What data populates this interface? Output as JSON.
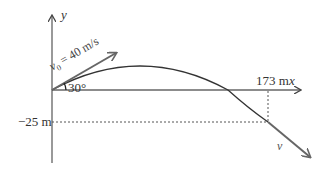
{
  "diagram": {
    "axes": {
      "x_label": "x",
      "y_label": "y"
    },
    "initial_velocity": {
      "symbol": "v",
      "subscript": "0",
      "value_text": " = 40 m/s",
      "angle_label": "30°"
    },
    "annotations": {
      "horizontal_distance": "173 m",
      "vertical_drop": "−25 m",
      "final_velocity": "v"
    },
    "colors": {
      "axes": "#555555",
      "trajectory": "#333333",
      "arrow": "#666666",
      "dashed": "#555555"
    }
  }
}
